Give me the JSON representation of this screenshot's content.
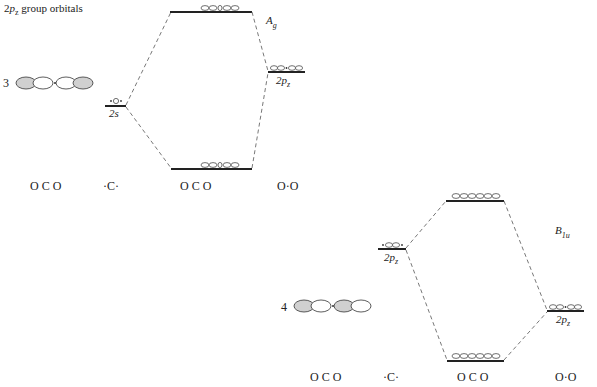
{
  "title": {
    "prefix": "2",
    "italic": "p",
    "sub": "z",
    "rest": " group orbitals"
  },
  "diagram_top": {
    "index": "3",
    "symmetry": {
      "main": "A",
      "sub": "g"
    },
    "left_level_label": "2s",
    "right_level_label": {
      "main": "2p",
      "sub": "z"
    },
    "bottom_labels": [
      "O C O",
      "·C·",
      "O C O",
      "O·O"
    ]
  },
  "diagram_bottom": {
    "index": "4",
    "symmetry": {
      "main": "B",
      "sub": "1u"
    },
    "left_level_label": {
      "main": "2p",
      "sub": "z"
    },
    "right_level_label": {
      "main": "2p",
      "sub": "z"
    },
    "bottom_labels": [
      "O C O",
      "·C·",
      "O C O",
      "O·O"
    ]
  }
}
